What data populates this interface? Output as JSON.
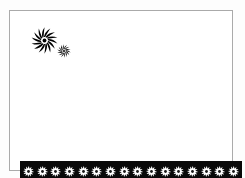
{
  "document": {
    "title": "Decorative Border Frame",
    "background_color": "#fdfdfd",
    "page_color": "#ffffff"
  },
  "frame": {
    "name": "page-frame",
    "border_color": "#aaaaaa",
    "border_width": 1,
    "fill_color": "#ffffff",
    "x": 9,
    "y": 10,
    "width": 224,
    "height": 161
  },
  "ornaments": {
    "pinwheel_large": {
      "icon": "pinwheel-flower-icon",
      "color": "#000000",
      "petal_count": 14,
      "size": 27,
      "x": 21,
      "y": 16
    },
    "pinwheel_small": {
      "icon": "pinwheel-flower-icon",
      "color": "#000000",
      "petal_count": 14,
      "size": 14,
      "x": 47,
      "y": 33
    }
  },
  "bottom_band": {
    "name": "ornamental-border-band",
    "background_color": "#090909",
    "x": 10,
    "y": 150,
    "width": 222,
    "height": 21,
    "motif": {
      "icon": "rosette-flower-icon",
      "petal_color": "#ffffff",
      "center_color": "#1a1a1a",
      "petal_count": 12,
      "size": 11
    },
    "motif_count": 16,
    "motifs": [
      {
        "index": 1
      },
      {
        "index": 2
      },
      {
        "index": 3
      },
      {
        "index": 4
      },
      {
        "index": 5
      },
      {
        "index": 6
      },
      {
        "index": 7
      },
      {
        "index": 8
      },
      {
        "index": 9
      },
      {
        "index": 10
      },
      {
        "index": 11
      },
      {
        "index": 12
      },
      {
        "index": 13
      },
      {
        "index": 14
      },
      {
        "index": 15
      },
      {
        "index": 16
      }
    ]
  }
}
